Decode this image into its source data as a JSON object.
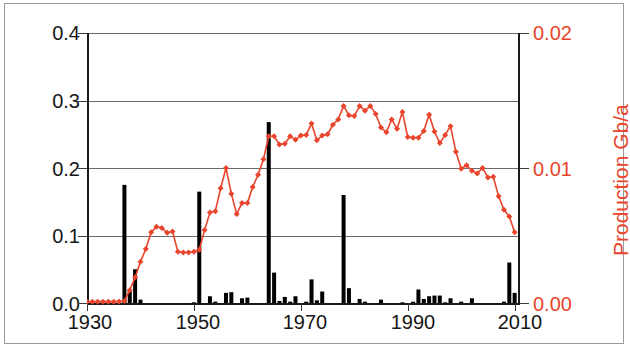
{
  "figure": {
    "background": "#ffffff",
    "bar_color": "#000000",
    "line_color": "#e8452c"
  },
  "axes": {
    "left_title": "Discovery Gb/a",
    "right_title": "Production Gb/a",
    "left_ticks": [
      "0.0",
      "0.1",
      "0.2",
      "0.3",
      "0.4"
    ],
    "right_ticks": [
      "0.00",
      "0.01",
      "0.02"
    ],
    "x_ticks": [
      "1930",
      "1950",
      "1970",
      "1990",
      "2010"
    ]
  },
  "chart_data": {
    "type": "bar",
    "title": "",
    "xlabel": "",
    "ylabel": "Discovery Gb/a",
    "y2label": "Production Gb/a",
    "xlim": [
      1930,
      2011
    ],
    "ylim": [
      0.0,
      0.4
    ],
    "y2lim": [
      0.0,
      0.02
    ],
    "grid": "horizontal",
    "legend": "none",
    "x": [
      1930,
      1931,
      1932,
      1933,
      1934,
      1935,
      1936,
      1937,
      1938,
      1939,
      1940,
      1941,
      1942,
      1943,
      1944,
      1945,
      1946,
      1947,
      1948,
      1949,
      1950,
      1951,
      1952,
      1953,
      1954,
      1955,
      1956,
      1957,
      1958,
      1959,
      1960,
      1961,
      1962,
      1963,
      1964,
      1965,
      1966,
      1967,
      1968,
      1969,
      1970,
      1971,
      1972,
      1973,
      1974,
      1975,
      1976,
      1977,
      1978,
      1979,
      1980,
      1981,
      1982,
      1983,
      1984,
      1985,
      1986,
      1987,
      1988,
      1989,
      1990,
      1991,
      1992,
      1993,
      1994,
      1995,
      1996,
      1997,
      1998,
      1999,
      2000,
      2001,
      2002,
      2003,
      2004,
      2005,
      2006,
      2007,
      2008,
      2009,
      2010
    ],
    "series": [
      {
        "name": "Discovery Gb/a",
        "type": "bar",
        "axis": "left",
        "color": "#000000",
        "values": [
          0.0,
          0.0,
          0.0,
          0.0,
          0.0,
          0.0,
          0.0,
          0.175,
          0.02,
          0.05,
          0.005,
          0.0,
          0.0,
          0.0,
          0.0,
          0.0,
          0.0,
          0.0,
          0.0,
          0.0,
          0.001,
          0.165,
          0.0,
          0.01,
          0.002,
          0.0,
          0.015,
          0.016,
          0.0,
          0.007,
          0.008,
          0.0,
          0.0,
          0.0,
          0.268,
          0.045,
          0.003,
          0.009,
          0.002,
          0.01,
          0.0,
          0.002,
          0.035,
          0.004,
          0.017,
          0.0,
          0.0,
          0.0,
          0.16,
          0.022,
          0.0,
          0.006,
          0.002,
          0.0,
          0.0,
          0.005,
          0.0,
          0.0,
          0.0,
          0.001,
          0.0,
          0.002,
          0.02,
          0.006,
          0.01,
          0.011,
          0.011,
          0.001,
          0.007,
          0.0,
          0.002,
          0.0,
          0.007,
          0.0,
          0.0,
          0.0,
          0.0,
          0.0,
          0.002,
          0.06,
          0.015
        ]
      },
      {
        "name": "Production Gb/a",
        "type": "line",
        "axis": "right",
        "color": "#e8452c",
        "marker": "diamond",
        "values": [
          0.0001,
          0.0001,
          0.0001,
          0.0001,
          0.0001,
          0.0001,
          0.00012,
          0.00015,
          0.00095,
          0.0019,
          0.00305,
          0.004,
          0.00525,
          0.00565,
          0.00555,
          0.0052,
          0.0053,
          0.0038,
          0.00375,
          0.00375,
          0.0038,
          0.00395,
          0.0054,
          0.0067,
          0.0068,
          0.0085,
          0.01,
          0.0081,
          0.0066,
          0.0074,
          0.0074,
          0.0086,
          0.0095,
          0.01065,
          0.01235,
          0.01235,
          0.01175,
          0.0118,
          0.01235,
          0.0121,
          0.0124,
          0.01245,
          0.0133,
          0.01205,
          0.0124,
          0.0125,
          0.0132,
          0.0136,
          0.0146,
          0.0139,
          0.01385,
          0.0146,
          0.01425,
          0.0146,
          0.014,
          0.013,
          0.01265,
          0.0136,
          0.0129,
          0.01415,
          0.0123,
          0.01225,
          0.01225,
          0.01275,
          0.01395,
          0.0127,
          0.01185,
          0.01245,
          0.0131,
          0.0112,
          0.00995,
          0.0102,
          0.0098,
          0.0096,
          0.01,
          0.0093,
          0.00935,
          0.0079,
          0.0069,
          0.0064,
          0.00525
        ]
      }
    ]
  }
}
